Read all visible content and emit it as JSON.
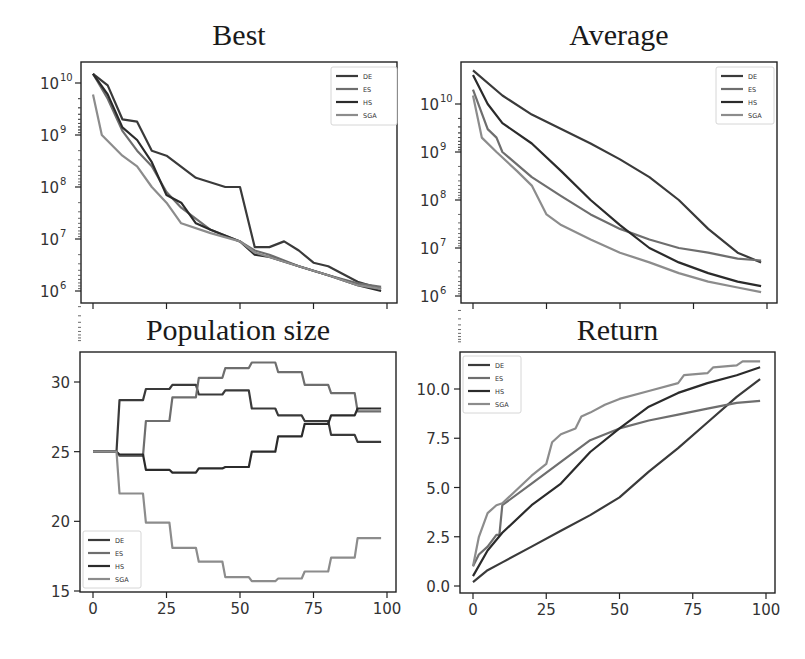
{
  "figure": {
    "series_names": [
      "DE",
      "ES",
      "HS",
      "SGA"
    ],
    "colors": {
      "DE": "#3a3a3a",
      "ES": "#6e6e6e",
      "HS": "#2b2b2b",
      "SGA": "#8c8c8c"
    }
  },
  "chart_data": [
    {
      "type": "line",
      "title": "Best",
      "xlabel": "",
      "ylabel": "",
      "yscale": "log",
      "x_ticks": [
        0,
        25,
        50,
        75,
        100
      ],
      "x_tick_labels_shown": false,
      "y_ticks": [
        "10^6",
        "10^7",
        "10^8",
        "10^9",
        "10^10"
      ],
      "ylim": [
        800000,
        20000000000
      ],
      "legend": {
        "entries": [
          "DE",
          "ES",
          "HS",
          "SGA"
        ],
        "position": "upper right"
      },
      "series": [
        {
          "name": "DE",
          "x": [
            0,
            5,
            10,
            15,
            20,
            25,
            35,
            45,
            50,
            55,
            60,
            65,
            70,
            75,
            80,
            90,
            98
          ],
          "values": [
            15000000000.0,
            9000000000.0,
            2000000000.0,
            1800000000.0,
            500000000.0,
            400000000.0,
            150000000.0,
            100000000.0,
            100000000.0,
            7000000.0,
            7000000.0,
            9000000.0,
            6000000.0,
            3500000.0,
            3000000.0,
            1500000.0,
            1100000.0
          ]
        },
        {
          "name": "ES",
          "x": [
            0,
            5,
            10,
            15,
            20,
            25,
            30,
            40,
            50,
            55,
            60,
            70,
            80,
            90,
            98
          ],
          "values": [
            15000000000.0,
            5000000000.0,
            1200000000.0,
            500000000.0,
            250000000.0,
            80000000.0,
            40000000.0,
            15000000.0,
            9000000.0,
            6000000.0,
            5000000.0,
            3000000.0,
            2000000.0,
            1400000.0,
            1200000.0
          ]
        },
        {
          "name": "HS",
          "x": [
            0,
            5,
            10,
            15,
            20,
            25,
            30,
            35,
            40,
            50,
            55,
            60,
            70,
            80,
            90,
            98
          ],
          "values": [
            15000000000.0,
            6000000000.0,
            1400000000.0,
            800000000.0,
            300000000.0,
            70000000.0,
            50000000.0,
            20000000.0,
            15000000.0,
            9000000.0,
            5000000.0,
            4500000.0,
            3000000.0,
            2000000.0,
            1300000.0,
            1000000.0
          ]
        },
        {
          "name": "SGA",
          "x": [
            0,
            3,
            10,
            15,
            20,
            25,
            30,
            40,
            50,
            55,
            60,
            70,
            80,
            90,
            98
          ],
          "values": [
            6000000000.0,
            1000000000.0,
            400000000.0,
            250000000.0,
            100000000.0,
            50000000.0,
            20000000.0,
            13000000.0,
            9000000.0,
            5500000.0,
            4500000.0,
            3000000.0,
            2000000.0,
            1300000.0,
            1100000.0
          ]
        }
      ]
    },
    {
      "type": "line",
      "title": "Average",
      "xlabel": "",
      "ylabel": "",
      "yscale": "log",
      "x_ticks": [
        0,
        25,
        50,
        75,
        100
      ],
      "x_tick_labels_shown": false,
      "y_ticks": [
        "10^6",
        "10^7",
        "10^8",
        "10^9",
        "10^10"
      ],
      "ylim": [
        800000,
        80000000000
      ],
      "legend": {
        "entries": [
          "DE",
          "ES",
          "HS",
          "SGA"
        ],
        "position": "upper right"
      },
      "series": [
        {
          "name": "DE",
          "x": [
            0,
            10,
            20,
            30,
            40,
            50,
            60,
            70,
            80,
            90,
            98
          ],
          "values": [
            50000000000.0,
            15000000000.0,
            6000000000.0,
            3000000000.0,
            1500000000.0,
            700000000.0,
            300000000.0,
            100000000.0,
            25000000.0,
            8000000.0,
            5000000.0
          ]
        },
        {
          "name": "ES",
          "x": [
            0,
            5,
            8,
            10,
            20,
            30,
            40,
            50,
            60,
            70,
            80,
            90,
            98
          ],
          "values": [
            20000000000.0,
            3000000000.0,
            2000000000.0,
            1000000000.0,
            300000000.0,
            120000000.0,
            50000000.0,
            25000000.0,
            15000000.0,
            10000000.0,
            8000000.0,
            6000000.0,
            5500000.0
          ]
        },
        {
          "name": "HS",
          "x": [
            0,
            5,
            10,
            20,
            30,
            40,
            50,
            60,
            70,
            80,
            90,
            98
          ],
          "values": [
            40000000000.0,
            10000000000.0,
            4000000000.0,
            1500000000.0,
            400000000.0,
            100000000.0,
            30000000.0,
            10000000.0,
            5000000.0,
            3000000.0,
            2000000.0,
            1600000.0
          ]
        },
        {
          "name": "SGA",
          "x": [
            0,
            3,
            8,
            15,
            20,
            25,
            30,
            40,
            50,
            60,
            70,
            80,
            90,
            98
          ],
          "values": [
            15000000000.0,
            2000000000.0,
            1000000000.0,
            400000000.0,
            200000000.0,
            50000000.0,
            30000000.0,
            15000000.0,
            8000000.0,
            5000000.0,
            3000000.0,
            2000000.0,
            1500000.0,
            1200000.0
          ]
        }
      ]
    },
    {
      "type": "line",
      "title": "Population size",
      "xlabel": "",
      "ylabel": "",
      "x_ticks": [
        0,
        25,
        50,
        75,
        100
      ],
      "y_ticks": [
        15,
        20,
        25,
        30
      ],
      "xlim": [
        -4,
        104
      ],
      "ylim": [
        15,
        32
      ],
      "legend": {
        "entries": [
          "DE",
          "ES",
          "HS",
          "SGA"
        ],
        "position": "lower left"
      },
      "series": [
        {
          "name": "DE",
          "x": [
            0,
            8,
            9,
            17,
            18,
            26,
            27,
            35,
            36,
            44,
            45,
            53,
            54,
            62,
            63,
            71,
            72,
            80,
            81,
            89,
            90,
            98
          ],
          "values": [
            25,
            25,
            28.7,
            28.7,
            29.5,
            29.5,
            29.8,
            29.8,
            29.1,
            29.1,
            29.4,
            29.4,
            28.1,
            28.1,
            27.6,
            27.6,
            27.2,
            27.2,
            26.2,
            26.2,
            25.7,
            25.7
          ]
        },
        {
          "name": "ES",
          "x": [
            0,
            8,
            9,
            17,
            18,
            26,
            27,
            35,
            36,
            44,
            45,
            53,
            54,
            62,
            63,
            71,
            72,
            80,
            81,
            89,
            90,
            98
          ],
          "values": [
            25,
            25,
            24.7,
            24.7,
            27.2,
            27.2,
            28.9,
            28.9,
            30.3,
            30.3,
            31.0,
            31.0,
            31.4,
            31.4,
            30.7,
            30.7,
            29.8,
            29.8,
            29.2,
            29.2,
            27.9,
            27.9
          ]
        },
        {
          "name": "HS",
          "x": [
            0,
            8,
            9,
            17,
            18,
            26,
            27,
            35,
            36,
            44,
            45,
            53,
            54,
            62,
            63,
            71,
            72,
            80,
            81,
            89,
            90,
            98
          ],
          "values": [
            25,
            25,
            24.8,
            24.8,
            23.7,
            23.7,
            23.5,
            23.5,
            23.8,
            23.8,
            23.9,
            23.9,
            25.0,
            25.0,
            26.1,
            26.1,
            27.0,
            27.0,
            27.6,
            27.6,
            28.1,
            28.1
          ]
        },
        {
          "name": "SGA",
          "x": [
            0,
            8,
            9,
            17,
            18,
            26,
            27,
            35,
            36,
            44,
            45,
            53,
            54,
            62,
            63,
            71,
            72,
            80,
            81,
            89,
            90,
            98
          ],
          "values": [
            25,
            25,
            22.0,
            22.0,
            19.9,
            19.9,
            18.1,
            18.1,
            17.1,
            17.1,
            16.0,
            16.0,
            15.7,
            15.7,
            15.9,
            15.9,
            16.4,
            16.4,
            17.4,
            17.4,
            18.8,
            18.8
          ]
        }
      ]
    },
    {
      "type": "line",
      "title": "Return",
      "xlabel": "",
      "ylabel": "",
      "x_ticks": [
        0,
        25,
        50,
        75,
        100
      ],
      "y_ticks": [
        0.0,
        2.5,
        5.0,
        7.5,
        10.0
      ],
      "y_tick_labels": [
        "0.0",
        "2.5",
        "5.0",
        "7.5",
        "10.0"
      ],
      "xlim": [
        -4,
        104
      ],
      "ylim": [
        -0.3,
        11.8
      ],
      "legend": {
        "entries": [
          "DE",
          "ES",
          "HS",
          "SGA"
        ],
        "position": "upper left"
      },
      "series": [
        {
          "name": "DE",
          "x": [
            0,
            5,
            10,
            20,
            30,
            40,
            50,
            60,
            70,
            80,
            90,
            98
          ],
          "values": [
            0.2,
            0.8,
            1.2,
            2.0,
            2.8,
            3.6,
            4.5,
            5.8,
            7.0,
            8.3,
            9.6,
            10.5
          ]
        },
        {
          "name": "ES",
          "x": [
            0,
            2,
            5,
            8,
            9,
            10,
            20,
            30,
            40,
            50,
            60,
            70,
            80,
            90,
            98
          ],
          "values": [
            1.0,
            1.6,
            2.0,
            2.6,
            2.6,
            4.1,
            5.2,
            6.3,
            7.4,
            8.0,
            8.4,
            8.7,
            9.0,
            9.3,
            9.4
          ]
        },
        {
          "name": "HS",
          "x": [
            0,
            5,
            10,
            20,
            30,
            40,
            50,
            60,
            70,
            80,
            90,
            98
          ],
          "values": [
            0.5,
            1.8,
            2.7,
            4.1,
            5.2,
            6.8,
            8.0,
            9.1,
            9.8,
            10.3,
            10.7,
            11.1
          ]
        },
        {
          "name": "SGA",
          "x": [
            0,
            2,
            5,
            8,
            10,
            20,
            25,
            27,
            30,
            35,
            37,
            40,
            45,
            50,
            60,
            70,
            72,
            80,
            82,
            90,
            92,
            98
          ],
          "values": [
            1.0,
            2.5,
            3.7,
            4.1,
            4.2,
            5.6,
            6.2,
            7.3,
            7.7,
            8.0,
            8.6,
            8.8,
            9.2,
            9.5,
            9.9,
            10.3,
            10.7,
            10.8,
            11.1,
            11.2,
            11.4,
            11.4
          ]
        }
      ]
    }
  ]
}
